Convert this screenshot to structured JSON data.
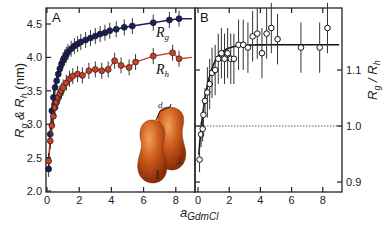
{
  "chart_data": [
    {
      "panel": "A",
      "type": "scatter",
      "title": "",
      "xlabel": "a_GdmCl",
      "ylabel": "R_g & R_h (nm)",
      "xlim": [
        0,
        9.2
      ],
      "ylim": [
        2.0,
        4.7
      ],
      "xticks": [
        0,
        2,
        4,
        6,
        8
      ],
      "yticks": [
        2.0,
        2.5,
        3.0,
        3.5,
        4.0,
        4.5
      ],
      "ytick_labels": [
        "2.0",
        "2.5",
        "3.0",
        "3.5",
        "4.0",
        "4.5"
      ],
      "grid": false,
      "series": [
        {
          "name": "R_g",
          "color": "#1a1f5c",
          "marker": "filled-circle",
          "fit_line": true,
          "x": [
            0.1,
            0.2,
            0.3,
            0.4,
            0.5,
            0.6,
            0.7,
            0.8,
            0.9,
            1.0,
            1.1,
            1.2,
            1.3,
            1.5,
            1.7,
            1.9,
            2.1,
            2.4,
            2.7,
            3.0,
            3.3,
            3.6,
            3.9,
            4.3,
            4.8,
            5.3,
            6.6,
            7.6,
            8.2
          ],
          "y": [
            2.33,
            2.85,
            3.2,
            3.4,
            3.55,
            3.65,
            3.75,
            3.83,
            3.9,
            3.96,
            4.0,
            4.04,
            4.08,
            4.13,
            4.17,
            4.2,
            4.23,
            4.26,
            4.29,
            4.32,
            4.35,
            4.37,
            4.4,
            4.42,
            4.45,
            4.47,
            4.52,
            4.56,
            4.58
          ],
          "fit_y_end": 4.58
        },
        {
          "name": "R_h",
          "color": "#c8402a",
          "marker": "filled-circle",
          "fit_line": true,
          "x": [
            0.1,
            0.2,
            0.3,
            0.4,
            0.5,
            0.6,
            0.7,
            0.8,
            0.9,
            1.0,
            1.2,
            1.4,
            1.6,
            1.9,
            2.2,
            2.6,
            3.0,
            3.4,
            3.8,
            4.2,
            4.6,
            5.1,
            5.5,
            6.6,
            7.8,
            8.2
          ],
          "y": [
            2.45,
            2.75,
            2.98,
            3.12,
            3.25,
            3.33,
            3.4,
            3.46,
            3.5,
            3.55,
            3.62,
            3.68,
            3.72,
            3.75,
            3.73,
            3.8,
            3.82,
            3.8,
            3.82,
            3.95,
            3.88,
            3.85,
            3.93,
            4.02,
            4.07,
            3.98
          ],
          "fit_y_end": 4.0
        }
      ],
      "annotations": [
        "A",
        "R_g",
        "R_h",
        "protein-dimer-inset (labels: d, ∥, ⊥)"
      ]
    },
    {
      "panel": "B",
      "type": "scatter",
      "title": "",
      "xlabel": "a_GdmCl",
      "ylabel": "R_g / R_h",
      "ylabel_side": "right",
      "xlim": [
        -0.3,
        9.2
      ],
      "ylim": [
        0.88,
        1.21
      ],
      "xticks": [
        0,
        2,
        4,
        6,
        8
      ],
      "yticks": [
        0.9,
        1.0,
        1.1
      ],
      "ytick_labels": [
        "0.9",
        "1.0",
        "1.1"
      ],
      "grid": false,
      "reference_line": {
        "y": 1.0,
        "style": "dotted"
      },
      "series": [
        {
          "name": "R_g/R_h",
          "color": "#111111",
          "marker": "open-circle",
          "fit_line": true,
          "x": [
            0.1,
            0.2,
            0.3,
            0.35,
            0.45,
            0.6,
            0.75,
            0.9,
            1.1,
            1.3,
            1.5,
            1.7,
            1.9,
            2.1,
            2.3,
            2.6,
            2.9,
            3.2,
            3.5,
            3.8,
            4.1,
            4.4,
            4.7,
            5.1,
            6.6,
            7.8,
            8.3
          ],
          "y": [
            0.94,
            0.985,
            0.995,
            1.02,
            1.045,
            1.06,
            1.075,
            1.095,
            1.1,
            1.12,
            1.13,
            1.12,
            1.13,
            1.12,
            1.12,
            1.145,
            1.145,
            1.14,
            1.16,
            1.165,
            1.13,
            1.165,
            1.175,
            1.155,
            1.14,
            1.14,
            1.175
          ],
          "error": 0.045
        }
      ],
      "annotations": [
        "B"
      ]
    }
  ],
  "figure": {
    "panel_a_label": "A",
    "panel_b_label": "B",
    "ylabel_left": "R",
    "ylabel_left_sub_g": "g",
    "ylabel_left_amp": " & R",
    "ylabel_left_sub_h": "h",
    "ylabel_left_unit": " (nm)",
    "ylabel_right": "R",
    "ylabel_right_sub_g": "g",
    "ylabel_right_slash": " / R",
    "ylabel_right_sub_h": "h",
    "xlabel_main": "a",
    "xlabel_sub": "GdmCl",
    "curve_label_rg": "R",
    "curve_label_rg_sub": "g",
    "curve_label_rh": "R",
    "curve_label_rh_sub": "h",
    "inset_label_d": "d",
    "inset_label_par": "∥",
    "inset_label_perp": "⊥",
    "colors": {
      "rg": "#1a1f5c",
      "rh": "#c8402a",
      "axis": "#222222",
      "inset": "#c85a1c"
    }
  }
}
